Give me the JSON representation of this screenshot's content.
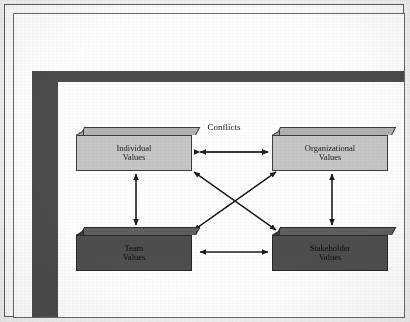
{
  "figure": {
    "type": "block-diagram",
    "title": "",
    "label_conflicts": "Conflicts",
    "boxes": [
      {
        "id": "individual",
        "line1": "Individual",
        "line2": "Values",
        "shade": "light",
        "position": "top-left"
      },
      {
        "id": "organizational",
        "line1": "Organizational",
        "line2": "Values",
        "shade": "light",
        "position": "top-right"
      },
      {
        "id": "team",
        "line1": "Team",
        "line2": "Values",
        "shade": "dark",
        "position": "bottom-left"
      },
      {
        "id": "stakeholder",
        "line1": "Stakeholder",
        "line2": "Values",
        "shade": "dark",
        "position": "bottom-right"
      }
    ],
    "connectors": [
      {
        "id": "top-horizontal",
        "from": "individual",
        "to": "organizational",
        "style": "double-arrow",
        "orientation": "horizontal"
      },
      {
        "id": "bottom-horizontal",
        "from": "team",
        "to": "stakeholder",
        "style": "double-arrow",
        "orientation": "horizontal"
      },
      {
        "id": "left-vertical",
        "from": "individual",
        "to": "team",
        "style": "double-arrow",
        "orientation": "vertical"
      },
      {
        "id": "right-vertical",
        "from": "organizational",
        "to": "stakeholder",
        "style": "double-arrow",
        "orientation": "vertical"
      },
      {
        "id": "diagonal-a",
        "from": "individual",
        "to": "stakeholder",
        "style": "double-arrow",
        "orientation": "diagonal"
      },
      {
        "id": "diagonal-b",
        "from": "organizational",
        "to": "team",
        "style": "double-arrow",
        "orientation": "diagonal"
      }
    ],
    "colors": {
      "light_box_face": "#c6c6c6",
      "dark_box_face": "#4e4e4e",
      "band": "#4c4c4c",
      "outline": "#3c3c3c",
      "page": "#ffffff",
      "arrow": "#1c1c1c"
    }
  }
}
